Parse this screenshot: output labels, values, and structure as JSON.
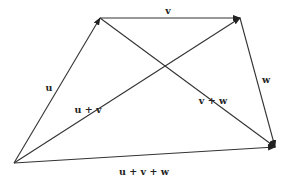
{
  "diagram": {
    "title": "",
    "colors": {
      "stroke": "#333333",
      "text": "#222222",
      "background": "#ffffff"
    },
    "points": {
      "O": [
        14,
        163
      ],
      "A": [
        100,
        18
      ],
      "B": [
        240,
        18
      ],
      "C": [
        275,
        147
      ]
    },
    "vectors": [
      {
        "id": "u",
        "from": "O",
        "to": "A",
        "label": "u",
        "label_pos": [
          49,
          91
        ]
      },
      {
        "id": "v",
        "from": "A",
        "to": "B",
        "label": "v",
        "label_pos": [
          168,
          14
        ]
      },
      {
        "id": "w",
        "from": "B",
        "to": "C",
        "label": "w",
        "label_pos": [
          266,
          83
        ]
      },
      {
        "id": "u_plus_v",
        "from": "O",
        "to": "B",
        "label": "u + v",
        "label_pos": [
          88,
          113
        ]
      },
      {
        "id": "v_plus_w",
        "from": "A",
        "to": "C",
        "label": "v + w",
        "label_pos": [
          213,
          104
        ]
      },
      {
        "id": "u_plus_v_plus_w",
        "from": "O",
        "to": "C",
        "label": "u + v + w",
        "label_pos": [
          144,
          175
        ]
      }
    ]
  }
}
